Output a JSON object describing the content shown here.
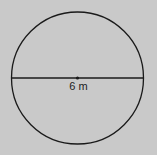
{
  "figure": {
    "shape": "circle",
    "segment": "diameter",
    "center_point": true,
    "label": "6 m",
    "colors": {
      "background": "#c9c9c9",
      "stroke": "#1a1a1a"
    }
  }
}
